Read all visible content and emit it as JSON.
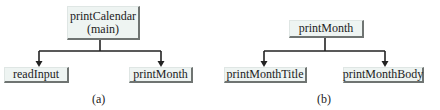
{
  "diagrams": [
    {
      "label": "(a)",
      "root": {
        "line1": "printCalendar",
        "line2": "(main)"
      },
      "children": [
        {
          "label": "readInput"
        },
        {
          "label": "printMonth"
        }
      ]
    },
    {
      "label": "(b)",
      "root": {
        "line1": "printMonth"
      },
      "children": [
        {
          "label": "printMonthTitle"
        },
        {
          "label": "printMonthBody"
        }
      ]
    }
  ],
  "colors": {
    "box_fill": "#eef4f2",
    "box_shadow": "#6f7472",
    "line": "#222222"
  }
}
